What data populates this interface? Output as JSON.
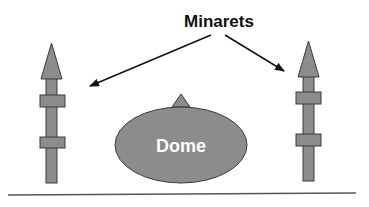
{
  "diagram": {
    "title_label": "Minarets",
    "dome_label": "Dome",
    "colors": {
      "fill": "#8c8c8c",
      "stroke": "#3a3a3a",
      "text_dark": "#111111",
      "text_light": "#ffffff",
      "ground": "#555555"
    }
  }
}
